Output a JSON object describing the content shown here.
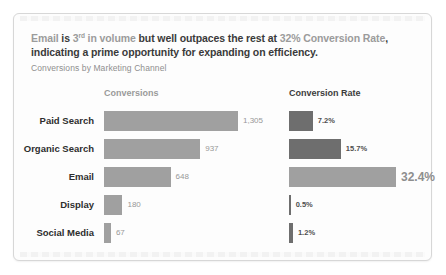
{
  "headline": {
    "segments": [
      {
        "text": "Email "
      },
      {
        "text": "is "
      },
      {
        "text": "3"
      },
      {
        "text": "rd"
      },
      {
        "text": " in volume "
      },
      {
        "text": "but well outpaces the rest at "
      },
      {
        "text": "32% Conversion Rate"
      },
      {
        "text": ", indicating a prime opportunity for expanding on efficiency."
      }
    ]
  },
  "subtitle": "Conversions by Marketing Channel",
  "chart_data": {
    "type": "bar",
    "orientation": "horizontal",
    "title": "Conversions by Marketing Channel",
    "categories": [
      "Paid Search",
      "Organic Search",
      "Email",
      "Display",
      "Social Media"
    ],
    "series": [
      {
        "name": "Conversions",
        "values": [
          1305,
          937,
          648,
          180,
          67
        ],
        "labels": [
          "1,305",
          "937",
          "648",
          "180",
          "67"
        ]
      },
      {
        "name": "Conversion Rate",
        "values": [
          7.2,
          15.7,
          32.4,
          0.5,
          1.2
        ],
        "labels": [
          "7.2%",
          "15.7%",
          "32.4%",
          "0.5%",
          "1.2%"
        ]
      }
    ],
    "highlight_category": "Email",
    "xlim_conversions": [
      0,
      1305
    ],
    "xlim_rate": [
      0,
      32.4
    ],
    "grid": "off",
    "legend": "column-headers"
  },
  "colors": {
    "conversions_bar": "#a0a0a0",
    "rate_bar": "#6e6e6e",
    "rate_bar_highlight": "#a0a0a0",
    "muted_text": "#9b9b9b",
    "strong_text": "#3a3a3a"
  }
}
